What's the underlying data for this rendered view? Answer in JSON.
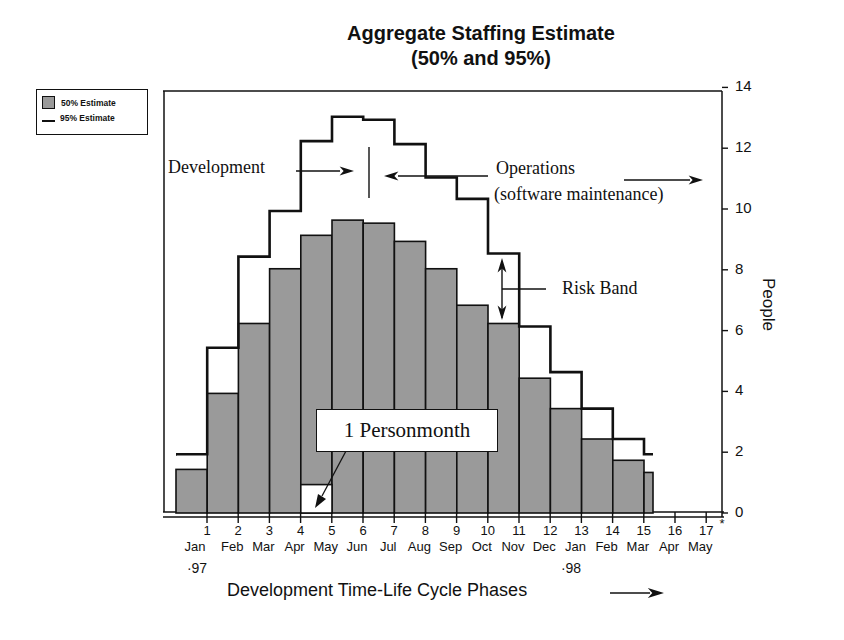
{
  "chart_data": {
    "type": "bar",
    "title": "Aggregate Staffing Estimate",
    "subtitle": "(50% and 95%)",
    "xlabel": "Development Time-Life Cycle Phases",
    "ylabel": "People",
    "ylim": [
      0,
      14
    ],
    "yticks": [
      0,
      2,
      4,
      6,
      8,
      10,
      12,
      14
    ],
    "y_axis_position": "right",
    "grid": false,
    "legend_position": "top-left-outside",
    "legend": [
      {
        "name": "50% Estimate",
        "style": "gray filled bars"
      },
      {
        "name": "95% Estimate",
        "style": "black step line"
      }
    ],
    "x_ticks": [
      {
        "num": "1",
        "month": "Jan",
        "year": "'97"
      },
      {
        "num": "2",
        "month": "Feb"
      },
      {
        "num": "3",
        "month": "Mar"
      },
      {
        "num": "4",
        "month": "Apr"
      },
      {
        "num": "5",
        "month": "May"
      },
      {
        "num": "6",
        "month": "Jun"
      },
      {
        "num": "7",
        "month": "Jul"
      },
      {
        "num": "8",
        "month": "Aug"
      },
      {
        "num": "9",
        "month": "Sep"
      },
      {
        "num": "10",
        "month": "Oct"
      },
      {
        "num": "11",
        "month": "Nov"
      },
      {
        "num": "12",
        "month": "Dec"
      },
      {
        "num": "13",
        "month": "Jan",
        "year": "'98"
      },
      {
        "num": "14",
        "month": "Feb"
      },
      {
        "num": "15",
        "month": "Mar"
      },
      {
        "num": "16",
        "month": "Apr"
      },
      {
        "num": "17",
        "month": "May"
      }
    ],
    "categories": [
      "1",
      "2",
      "3",
      "4",
      "5",
      "6",
      "7",
      "8",
      "9",
      "10",
      "11",
      "12",
      "13",
      "14",
      "15",
      "15.3"
    ],
    "series": [
      {
        "name": "50% Estimate",
        "values": [
          1.5,
          4.0,
          6.3,
          8.1,
          9.2,
          9.7,
          9.6,
          9.0,
          8.1,
          6.9,
          6.3,
          4.5,
          3.5,
          2.5,
          1.8,
          1.4
        ]
      },
      {
        "name": "95% Estimate",
        "values": [
          2.0,
          5.5,
          8.5,
          10.0,
          12.3,
          13.1,
          13.0,
          12.2,
          11.1,
          10.4,
          8.6,
          6.2,
          4.7,
          3.5,
          2.5,
          2.0
        ]
      }
    ],
    "annotations": [
      {
        "text": "Development",
        "arrow": "right",
        "target": "phase boundary at month 6"
      },
      {
        "text": "Operations",
        "text2": "(software maintenance)",
        "arrow": "left and right"
      },
      {
        "text": "Risk Band",
        "arrow": "double vertical between 50% and 95% at month 10"
      },
      {
        "text": "1 Personmonth",
        "arrow": "points to unit square at month 4"
      }
    ]
  },
  "labels": {
    "title_line1": "Aggregate Staffing Estimate",
    "title_line2": "(50% and 95%)",
    "legend_50": "50% Estimate",
    "legend_95": "95% Estimate",
    "ylabel": "People",
    "xlabel": "Development Time-Life Cycle Phases",
    "development": "Development",
    "operations": "Operations",
    "operations_sub": "(software maintenance)",
    "risk_band": "Risk Band",
    "personmonth": "1 Personmonth",
    "year_97": "·97",
    "year_98": "·98",
    "asterisk": "*"
  },
  "colors": {
    "bar_fill": "#9a9a9a",
    "line": "#111111",
    "background": "#ffffff"
  }
}
